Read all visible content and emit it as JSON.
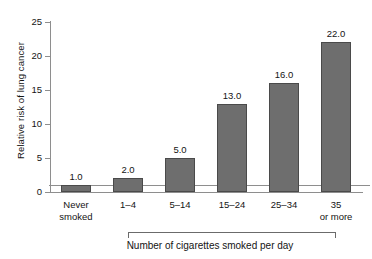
{
  "chart_data": {
    "type": "bar",
    "title": "",
    "xlabel": "Number of cigarettes smoked per day",
    "ylabel": "Relative risk of lung cancer",
    "categories": [
      "Never smoked",
      "1–4",
      "5–14",
      "15–24",
      "25–34",
      "35 or more"
    ],
    "category_lines": [
      [
        "Never",
        "smoked"
      ],
      [
        "1–4",
        ""
      ],
      [
        "5–14",
        ""
      ],
      [
        "15–24",
        ""
      ],
      [
        "25–34",
        ""
      ],
      [
        "35",
        "or more"
      ]
    ],
    "values": [
      1.0,
      2.0,
      5.0,
      13.0,
      16.0,
      22.0
    ],
    "value_labels": [
      "1.0",
      "2.0",
      "5.0",
      "13.0",
      "16.0",
      "22.0"
    ],
    "ylim": [
      0,
      25
    ],
    "yticks": [
      0,
      5,
      10,
      15,
      20,
      25
    ],
    "ytick_labels": [
      "0",
      "5",
      "10",
      "15",
      "20",
      "25"
    ],
    "grid": false,
    "legend": "none",
    "reference_line": {
      "value": 1.0,
      "label": ""
    },
    "bracket": {
      "label": "Number of cigarettes smoked per day",
      "from_category": "1–4",
      "to_category": "35 or more"
    },
    "colors": {
      "bar_fill": "#6e6e6e",
      "bar_edge": "#4a4a4a",
      "axis": "#8e8e8e",
      "text": "#141414",
      "background": "#ffffff"
    }
  }
}
